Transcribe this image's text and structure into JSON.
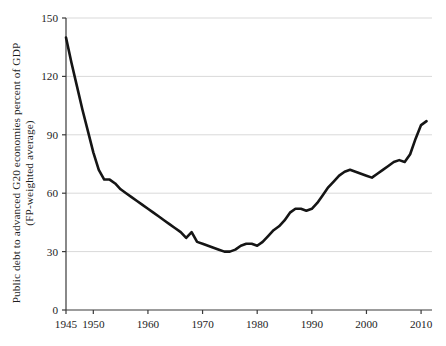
{
  "chart_data": {
    "type": "line",
    "title": "",
    "xlabel": "",
    "ylabel_line1": "Public debt to advanced G20 economies percent of GDP",
    "ylabel_line2": "(FP-weighted average)",
    "xlim": [
      1945,
      2012
    ],
    "ylim": [
      0,
      150
    ],
    "yticks": [
      0,
      30,
      60,
      90,
      120,
      150
    ],
    "ytick_labels": [
      "0",
      "30",
      "60",
      "90",
      "120",
      "150"
    ],
    "xticks": [
      1945,
      1950,
      1960,
      1970,
      1980,
      1990,
      2000,
      2010
    ],
    "xtick_labels": [
      "1945",
      "1950",
      "1960",
      "1970",
      "1980",
      "1990",
      "2000",
      "2010"
    ],
    "grid": true,
    "grid_axis": "y",
    "grid_color": "#d9d9d9",
    "line_color": "#151515",
    "line_width": 2.6,
    "legend": null,
    "series": [
      {
        "name": "Public debt (percent of GDP)",
        "x": [
          1945,
          1946,
          1947,
          1948,
          1949,
          1950,
          1951,
          1952,
          1953,
          1954,
          1955,
          1956,
          1957,
          1958,
          1959,
          1960,
          1961,
          1962,
          1963,
          1964,
          1965,
          1966,
          1967,
          1968,
          1969,
          1970,
          1971,
          1972,
          1973,
          1974,
          1975,
          1976,
          1977,
          1978,
          1979,
          1980,
          1981,
          1982,
          1983,
          1984,
          1985,
          1986,
          1987,
          1988,
          1989,
          1990,
          1991,
          1992,
          1993,
          1994,
          1995,
          1996,
          1997,
          1998,
          1999,
          2000,
          2001,
          2002,
          2003,
          2004,
          2005,
          2006,
          2007,
          2008,
          2009,
          2010,
          2011
        ],
        "values": [
          140,
          127,
          115,
          103,
          92,
          81,
          72,
          67,
          67,
          65,
          62,
          60,
          58,
          56,
          54,
          52,
          50,
          48,
          46,
          44,
          42,
          40,
          37,
          40,
          35,
          34,
          33,
          32,
          31,
          30,
          30,
          31,
          33,
          34,
          34,
          33,
          35,
          38,
          41,
          43,
          46,
          50,
          52,
          52,
          51,
          52,
          55,
          59,
          63,
          66,
          69,
          71,
          72,
          71,
          70,
          69,
          68,
          70,
          72,
          74,
          76,
          77,
          76,
          80,
          88,
          95,
          97
        ]
      }
    ]
  }
}
